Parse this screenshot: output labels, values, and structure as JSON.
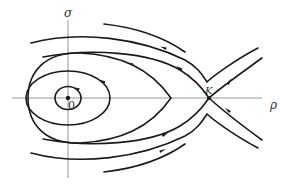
{
  "diagram": {
    "type": "phase-portrait",
    "axes": {
      "horizontal_label": "ρ",
      "vertical_label": "σ"
    },
    "points": {
      "origin_label": "0",
      "saddle_label": "K"
    },
    "colors": {
      "curve": "#1a1a1a",
      "axis": "#8a8a8a",
      "background": "#ffffff"
    }
  }
}
